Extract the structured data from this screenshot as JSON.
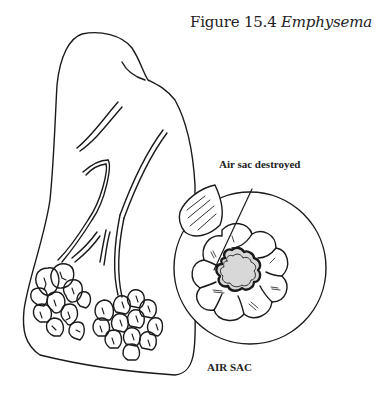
{
  "figure": {
    "number_label": "Figure 15.4",
    "title_italic": "Emphysema"
  },
  "labels": {
    "air_sac_destroyed": "Air sac destroyed",
    "air_sac": "AIR SAC"
  },
  "colors": {
    "line": "#1a1a1a",
    "shading": "#d8d8d8",
    "background": "#ffffff"
  }
}
